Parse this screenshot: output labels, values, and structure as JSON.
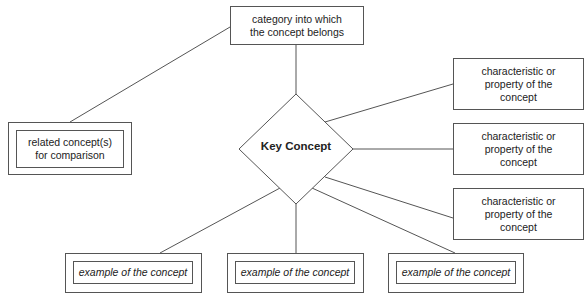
{
  "diagram": {
    "type": "concept-map",
    "central": {
      "label": "Key Concept",
      "shape": "diamond"
    },
    "category": {
      "label": "category into which\nthe concept belongs"
    },
    "related": {
      "label": "related concept(s)\nfor comparison"
    },
    "characteristics": [
      {
        "label": "characteristic or\nproperty of the\nconcept"
      },
      {
        "label": "characteristic or\nproperty of the\nconcept"
      },
      {
        "label": "characteristic or\nproperty of the\nconcept"
      }
    ],
    "examples": [
      {
        "label": "example of the concept"
      },
      {
        "label": "example of the concept"
      },
      {
        "label": "example of the concept"
      }
    ],
    "colors": {
      "stroke": "#555555",
      "text": "#222222",
      "background": "#ffffff"
    }
  }
}
